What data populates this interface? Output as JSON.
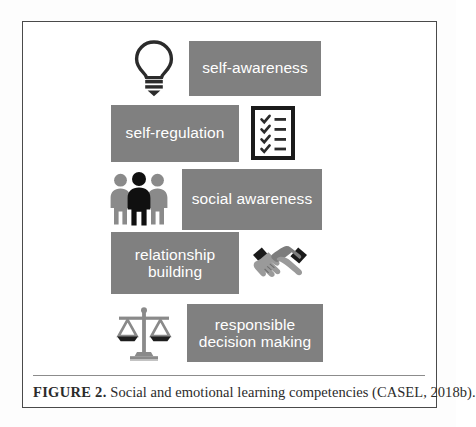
{
  "figure": {
    "caption_label": "FIGURE 2.",
    "caption_text": " Social and emotional learning competencies (CASEL, 2018b).",
    "frame_color": "#4a4a4a",
    "bar_color": "#808080",
    "bar_text_color": "#ffffff",
    "icon_dark_color": "#1a1a1a",
    "icon_gray_color": "#8a8a8a"
  },
  "competencies": [
    {
      "label": "self-awareness",
      "icon": "lightbulb-icon",
      "icon_position": "left"
    },
    {
      "label": "self-regulation",
      "icon": "checklist-icon",
      "icon_position": "right"
    },
    {
      "label": "social awareness",
      "icon": "three-people-icon",
      "icon_position": "left"
    },
    {
      "label": "relationship\nbuilding",
      "icon": "handshake-icon",
      "icon_position": "right"
    },
    {
      "label": "responsible\ndecision making",
      "icon": "balance-scales-icon",
      "icon_position": "left"
    }
  ]
}
